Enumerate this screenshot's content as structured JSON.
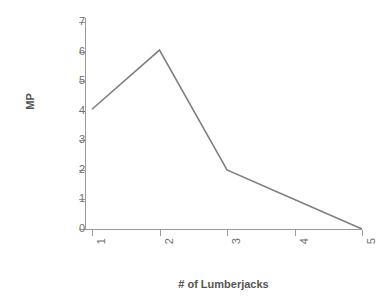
{
  "chart_data": {
    "type": "line",
    "title": "",
    "xlabel": "# of Lumberjacks",
    "ylabel": "MP",
    "x": [
      1,
      2,
      3,
      4,
      5
    ],
    "categories": [
      "1",
      "2",
      "3",
      "4",
      "5"
    ],
    "series": [
      {
        "name": "MP",
        "values": [
          4.05,
          6.05,
          2.0,
          1.0,
          0.0
        ],
        "color": "#808080"
      }
    ],
    "xlim": [
      1,
      5
    ],
    "ylim": [
      0,
      7
    ],
    "yticks": [
      0,
      1,
      2,
      3,
      4,
      5,
      6,
      7
    ],
    "ytick_labels": [
      "0",
      "1",
      "2",
      "3",
      "4",
      "5",
      "6",
      "7"
    ],
    "xticks": [
      1,
      2,
      3,
      4,
      5
    ],
    "xtick_labels": [
      "1",
      "2",
      "3",
      "4",
      "5"
    ],
    "xtick_label_rotation": -90,
    "grid": false,
    "legend": false,
    "markers": false,
    "axis_color": "#9a9a9a",
    "tick_label_color": "#6f6f6f",
    "axis_title_color": "#555555",
    "background_color": "#ffffff"
  }
}
